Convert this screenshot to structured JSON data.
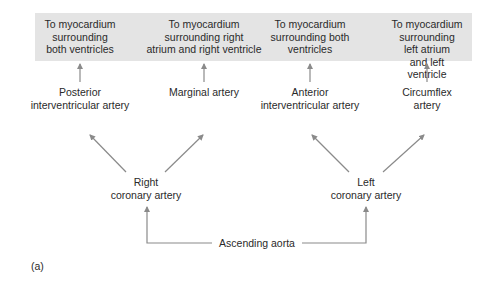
{
  "diagram": {
    "targets": [
      {
        "label": "To myocardium\nsurrounding\nboth ventricles"
      },
      {
        "label": "To myocardium\nsurrounding right\natrium and right ventricle"
      },
      {
        "label": "To myocardium\nsurrounding both\nventricles"
      },
      {
        "label": "To myocardium\nsurrounding left atrium\nand left ventricle"
      }
    ],
    "branches": [
      {
        "label": "Posterior\ninterventricular artery"
      },
      {
        "label": "Marginal artery"
      },
      {
        "label": "Anterior\ninterventricular artery"
      },
      {
        "label": "Circumflex\nartery"
      }
    ],
    "coronary": [
      {
        "label": "Right\ncoronary artery"
      },
      {
        "label": "Left\ncoronary artery"
      }
    ],
    "root": {
      "label": "Ascending aorta"
    },
    "panel_label": "(a)",
    "colors": {
      "box": "#e4e4e4",
      "arrow": "#8a8a8a",
      "text": "#2a2a2a"
    }
  }
}
